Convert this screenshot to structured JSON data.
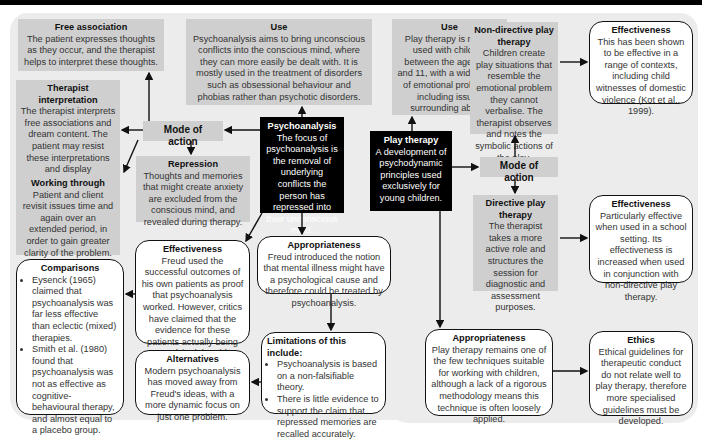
{
  "psychoanalysis": {
    "free_association": {
      "title": "Free association",
      "body": "The patient expresses thoughts as they occur, and the therapist helps to interpret these thoughts."
    },
    "use": {
      "title": "Use",
      "body": "Psychoanalysis aims to bring unconscious conflicts into the conscious mind, where they can more easily be dealt with. It is mostly used in the treatment of disorders such as obsessional behaviour and phobias rather than psychotic disorders."
    },
    "therapist_interpretation": {
      "title": "Therapist interpretation",
      "body": "The therapist interprets free associations and dream content. The patient may resist these interpretations and display transference towards the therapist."
    },
    "mode_of_action": {
      "label": "Mode of action"
    },
    "central": {
      "title": "Psychoanalysis",
      "body": "The focus of psychoanalysis is the removal of underlying conflicts the person has repressed into their unconscious mind."
    },
    "repression": {
      "title": "Repression",
      "body": "Thoughts and memories that might create anxiety are excluded from the conscious mind, and revealed during therapy."
    },
    "working_through": {
      "title": "Working through",
      "body": "Patient and client revisit issues time and again over an extended period, in order to gain greater clarity of the problem."
    },
    "effectiveness": {
      "title": "Effectiveness",
      "body": "Freud used the successful outcomes of his own patients as proof that psychoanalysis worked. However, critics have claimed that the evidence for these patients actually being 'cured' is debatable (Guttman, 2001)."
    },
    "appropriateness": {
      "title": "Appropriateness",
      "body": "Freud introduced the notion that mental illness might have a psychological cause and therefore could be treated by psychoanalysis."
    },
    "comparisons": {
      "title": "Comparisons",
      "items": [
        "Eysenck (1965) claimed that psychoanalysis was far less effective than eclectic (mixed) therapies.",
        "Smith et al. (1980) found that psychoanalysis was not as effective as cognitive-behavioural therapy, and almost equal to a placebo group."
      ]
    },
    "limitations": {
      "title": "Limitations of this include:",
      "items": [
        "Psychoanalysis is based on a non-falsifiable theory.",
        "There is little evidence to support the claim that repressed memories are recalled accurately."
      ]
    },
    "alternatives": {
      "title": "Alternatives",
      "body": "Modern psychoanalysis has moved away from Freud's ideas, with a more dynamic focus on just one problem."
    }
  },
  "play_therapy": {
    "use": {
      "title": "Use",
      "body": "Play therapy is mostly used with children between the ages of 3 and 11, with a wide range of emotional problems, including issues surrounding abuse."
    },
    "non_directive": {
      "title": "Non-directive play therapy",
      "body": "Children create play situations that resemble the emotional problem they cannot verbalise. The therapist observes and notes the symbolic actions of the play."
    },
    "effectiveness_1": {
      "title": "Effectiveness",
      "body": "This has been shown to be effective in a range of contexts, including child witnesses of domestic violence (Kot et al., 1999)."
    },
    "central": {
      "title": "Play therapy",
      "body": "A development of psychodynamic principles used exclusively for young children."
    },
    "mode_of_action": {
      "label": "Mode of action"
    },
    "directive": {
      "title": "Directive play therapy",
      "body": "The therapist takes a more active role and structures the session for diagnostic and assessment purposes."
    },
    "effectiveness_2": {
      "title": "Effectiveness",
      "body": "Particularly effective when used in a school setting. Its effectiveness is increased when used in conjunction with non-directive play therapy."
    },
    "appropriateness": {
      "title": "Appropriateness",
      "body": "Play therapy remains one of the few techniques suitable for working with children, although a lack of a rigorous methodology means this technique is often loosely applied."
    },
    "ethics": {
      "title": "Ethics",
      "body": "Ethical guidelines for therapeutic conduct do not relate well to play therapy, therefore more specialised guidelines must be developed."
    }
  }
}
